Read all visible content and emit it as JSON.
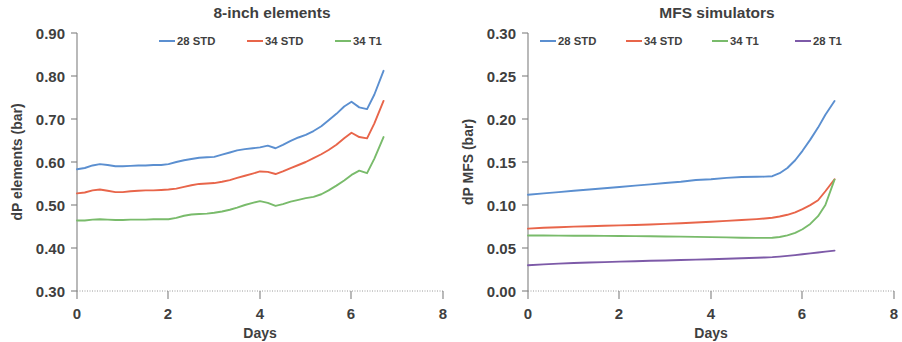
{
  "figure": {
    "panels": [
      "left",
      "right"
    ]
  },
  "left_panel": {
    "title": "8-inch elements",
    "ylabel": "dP elements (bar)",
    "xlabel": "Days",
    "ytick_labels": [
      "0.90",
      "0.80",
      "0.70",
      "0.60",
      "0.50",
      "0.40",
      "0.30"
    ],
    "xtick_labels": [
      "0",
      "2",
      "4",
      "6",
      "8"
    ],
    "legend": [
      {
        "label": "28 STD",
        "color": "#5b8fd0"
      },
      {
        "label": "34 STD",
        "color": "#e8654a"
      },
      {
        "label": "34 T1",
        "color": "#79bb6b"
      }
    ]
  },
  "right_panel": {
    "title": "MFS simulators",
    "ylabel": "dP MFS (bar)",
    "xlabel": "Days",
    "ytick_labels": [
      "0.30",
      "0.25",
      "0.20",
      "0.15",
      "0.10",
      "0.05",
      "0.00"
    ],
    "xtick_labels": [
      "0",
      "2",
      "4",
      "6",
      "8"
    ],
    "legend": [
      {
        "label": "28 STD",
        "color": "#5b8fd0"
      },
      {
        "label": "34 STD",
        "color": "#e8654a"
      },
      {
        "label": "34 T1",
        "color": "#79bb6b"
      },
      {
        "label": "28 T1",
        "color": "#7d5aa8"
      }
    ]
  },
  "chart_data": [
    {
      "type": "line",
      "title": "8-inch elements",
      "xlabel": "Days",
      "ylabel": "dP elements (bar)",
      "xlim": [
        0,
        8
      ],
      "ylim": [
        0.3,
        0.9
      ],
      "xticks": [
        0,
        2,
        4,
        6,
        8
      ],
      "yticks": [
        0.3,
        0.4,
        0.5,
        0.6,
        0.7,
        0.8,
        0.9
      ],
      "grid": false,
      "legend_position": "top",
      "x": [
        0.0,
        0.17,
        0.34,
        0.5,
        0.67,
        0.84,
        1.0,
        1.17,
        1.34,
        1.5,
        1.67,
        1.84,
        2.0,
        2.17,
        2.34,
        2.5,
        2.67,
        2.84,
        3.0,
        3.17,
        3.34,
        3.5,
        3.67,
        3.84,
        4.0,
        4.17,
        4.34,
        4.5,
        4.67,
        4.84,
        5.0,
        5.17,
        5.34,
        5.5,
        5.67,
        5.84,
        6.0,
        6.17,
        6.34,
        6.5,
        6.7
      ],
      "series": [
        {
          "name": "28 STD",
          "color": "#5b8fd0",
          "values": [
            0.583,
            0.586,
            0.592,
            0.595,
            0.593,
            0.59,
            0.59,
            0.591,
            0.592,
            0.592,
            0.593,
            0.593,
            0.595,
            0.6,
            0.604,
            0.607,
            0.61,
            0.611,
            0.612,
            0.617,
            0.622,
            0.627,
            0.63,
            0.632,
            0.634,
            0.638,
            0.632,
            0.64,
            0.649,
            0.657,
            0.663,
            0.672,
            0.683,
            0.697,
            0.712,
            0.729,
            0.74,
            0.727,
            0.723,
            0.757,
            0.812
          ]
        },
        {
          "name": "34 STD",
          "color": "#e8654a",
          "values": [
            0.527,
            0.529,
            0.534,
            0.536,
            0.533,
            0.53,
            0.53,
            0.532,
            0.533,
            0.534,
            0.534,
            0.535,
            0.536,
            0.538,
            0.542,
            0.546,
            0.549,
            0.55,
            0.551,
            0.554,
            0.558,
            0.563,
            0.568,
            0.573,
            0.578,
            0.577,
            0.572,
            0.578,
            0.586,
            0.593,
            0.6,
            0.609,
            0.618,
            0.628,
            0.64,
            0.655,
            0.668,
            0.658,
            0.655,
            0.69,
            0.742
          ]
        },
        {
          "name": "34 T1",
          "color": "#79bb6b",
          "values": [
            0.464,
            0.464,
            0.466,
            0.467,
            0.466,
            0.465,
            0.465,
            0.466,
            0.466,
            0.466,
            0.467,
            0.467,
            0.467,
            0.47,
            0.475,
            0.478,
            0.479,
            0.48,
            0.482,
            0.485,
            0.489,
            0.494,
            0.5,
            0.505,
            0.509,
            0.505,
            0.498,
            0.502,
            0.508,
            0.512,
            0.516,
            0.519,
            0.525,
            0.534,
            0.545,
            0.557,
            0.57,
            0.58,
            0.574,
            0.608,
            0.658
          ]
        }
      ]
    },
    {
      "type": "line",
      "title": "MFS simulators",
      "xlabel": "Days",
      "ylabel": "dP MFS (bar)",
      "xlim": [
        0,
        8
      ],
      "ylim": [
        0.0,
        0.3
      ],
      "xticks": [
        0,
        2,
        4,
        6,
        8
      ],
      "yticks": [
        0.0,
        0.05,
        0.1,
        0.15,
        0.2,
        0.25,
        0.3
      ],
      "grid": false,
      "legend_position": "top",
      "x": [
        0.0,
        0.34,
        0.67,
        1.0,
        1.34,
        1.67,
        2.0,
        2.34,
        2.67,
        3.0,
        3.34,
        3.67,
        4.0,
        4.34,
        4.67,
        5.0,
        5.17,
        5.34,
        5.5,
        5.67,
        5.84,
        6.0,
        6.17,
        6.34,
        6.5,
        6.7
      ],
      "series": [
        {
          "name": "28 STD",
          "color": "#5b8fd0",
          "values": [
            0.112,
            0.1135,
            0.115,
            0.1165,
            0.118,
            0.1195,
            0.121,
            0.1225,
            0.124,
            0.1255,
            0.127,
            0.129,
            0.13,
            0.1315,
            0.1325,
            0.1328,
            0.133,
            0.1335,
            0.137,
            0.143,
            0.152,
            0.163,
            0.176,
            0.19,
            0.205,
            0.221
          ]
        },
        {
          "name": "34 STD",
          "color": "#e8654a",
          "values": [
            0.0725,
            0.0735,
            0.0742,
            0.0748,
            0.0753,
            0.0758,
            0.0763,
            0.0768,
            0.0774,
            0.078,
            0.0788,
            0.0797,
            0.0806,
            0.0815,
            0.0825,
            0.0836,
            0.0843,
            0.0852,
            0.0866,
            0.0886,
            0.0915,
            0.0952,
            0.0998,
            0.1055,
            0.116,
            0.13
          ]
        },
        {
          "name": "34 T1",
          "color": "#79bb6b",
          "values": [
            0.0645,
            0.0645,
            0.0644,
            0.0643,
            0.0642,
            0.0641,
            0.064,
            0.0638,
            0.0636,
            0.0634,
            0.0632,
            0.0629,
            0.0626,
            0.0623,
            0.062,
            0.0618,
            0.0618,
            0.062,
            0.0628,
            0.0646,
            0.0675,
            0.0718,
            0.078,
            0.087,
            0.1,
            0.1295
          ]
        },
        {
          "name": "28 T1",
          "color": "#7d5aa8",
          "values": [
            0.03,
            0.031,
            0.0318,
            0.0325,
            0.0331,
            0.0336,
            0.0341,
            0.0346,
            0.0351,
            0.0355,
            0.036,
            0.0365,
            0.037,
            0.0375,
            0.038,
            0.0386,
            0.039,
            0.0394,
            0.04,
            0.0408,
            0.0417,
            0.0427,
            0.0437,
            0.0447,
            0.0458,
            0.047
          ]
        }
      ]
    }
  ]
}
